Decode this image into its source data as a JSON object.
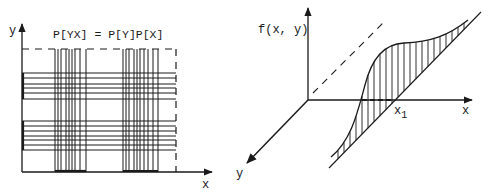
{
  "left_figure": {
    "y_axis_label": "y",
    "x_axis_label": "x",
    "title": "P[YX] = P[Y]P[X]",
    "vertical_lines_group1_x": [
      55,
      58,
      61,
      66,
      69,
      72,
      75,
      80,
      86
    ],
    "vertical_lines_group2_x": [
      123,
      126,
      129,
      134,
      137,
      140,
      144,
      148,
      153,
      158
    ],
    "horizontal_lines_group1_y": [
      73,
      78,
      84,
      88,
      93,
      99
    ],
    "horizontal_lines_group2_y": [
      121,
      126,
      131,
      136,
      140,
      145,
      150
    ]
  },
  "right_figure": {
    "vertical_axis_label": "f(x, y)",
    "x_axis_label": "x",
    "y_axis_label": "y",
    "x1_label": "x",
    "x1_subscript": "1"
  },
  "colors": {
    "ink": "#1a1a1a",
    "background": "#ffffff"
  }
}
